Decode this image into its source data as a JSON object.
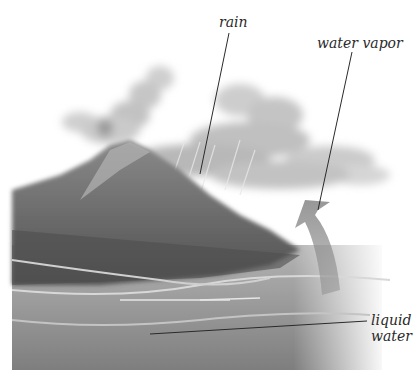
{
  "diagram": {
    "type": "illustration",
    "colors": {
      "background": "#ffffff",
      "mountain_dark": "#5a5a5a",
      "mountain_light": "#9a9a9a",
      "water": "#8c8c8c",
      "cloud": "#c8c8c8",
      "arrow": "#8a8a8a",
      "leader_line": "#2a2a2a",
      "label_text": "#2a2a2a"
    },
    "labels": [
      {
        "id": "rain",
        "text": "rain"
      },
      {
        "id": "water_vapor",
        "text": "water vapor"
      },
      {
        "id": "liquid_water",
        "line1": "liquid",
        "line2": "water"
      }
    ]
  }
}
